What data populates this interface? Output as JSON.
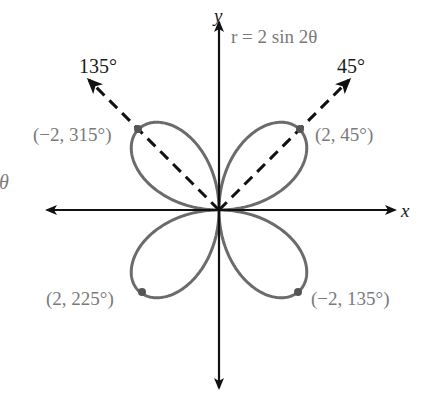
{
  "figure": {
    "equation": "r = 2 sin 2θ",
    "axes": {
      "x_label": "x",
      "y_label": "y"
    },
    "rays": [
      {
        "angle_label": "135°",
        "angle_deg": 135
      },
      {
        "angle_label": "45°",
        "angle_deg": 45
      }
    ],
    "points": [
      {
        "label": "(2, 45°)",
        "r": 2,
        "theta_deg": 45
      },
      {
        "label": "(−2, 315°)",
        "r": -2,
        "theta_deg": 315
      },
      {
        "label": "(2, 225°)",
        "r": 2,
        "theta_deg": 225
      },
      {
        "label": "(−2, 135°)",
        "r": -2,
        "theta_deg": 135
      }
    ],
    "edge_fragment": "θ",
    "colors": {
      "axes": "#111111",
      "curve": "#6b6b6b",
      "labels_gray": "#7a7a7a",
      "labels_black": "#1a1a1a"
    }
  },
  "chart_data": {
    "type": "polar-curve",
    "title": "r = 2 sin 2θ",
    "curve": "four-leaved rose, r = 2 sin 2θ",
    "petal_tips": [
      {
        "label": "(2, 45°)",
        "x": 1.414,
        "y": 1.414
      },
      {
        "label": "(−2, 315°)",
        "x": -1.414,
        "y": 1.414
      },
      {
        "label": "(2, 225°)",
        "x": -1.414,
        "y": -1.414
      },
      {
        "label": "(−2, 135°)",
        "x": 1.414,
        "y": -1.414
      }
    ],
    "dashed_rays_deg": [
      45,
      135
    ],
    "xlabel": "x",
    "ylabel": "y",
    "grid": false
  }
}
